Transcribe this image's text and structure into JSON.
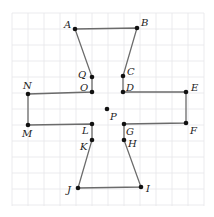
{
  "diagram": {
    "type": "polygon-on-grid",
    "grid": {
      "x0": 12,
      "y0": 13,
      "x1": 204,
      "y1": 206,
      "step": 16,
      "color": "#e6e6ea"
    },
    "edge_color": "#6b6b6b",
    "point_color": "#111111",
    "polygon_order": [
      "A",
      "B",
      "C",
      "D",
      "E",
      "F",
      "G",
      "H",
      "I",
      "J",
      "K",
      "L",
      "M",
      "N",
      "O",
      "Q"
    ],
    "points": [
      {
        "name": "A",
        "x": 75,
        "y": 29,
        "label": "A",
        "lx": 64,
        "ly": 28
      },
      {
        "name": "B",
        "x": 137,
        "y": 28,
        "label": "B",
        "lx": 141,
        "ly": 26
      },
      {
        "name": "C",
        "x": 123,
        "y": 76,
        "label": "C",
        "lx": 127,
        "ly": 75
      },
      {
        "name": "D",
        "x": 123,
        "y": 92,
        "label": "D",
        "lx": 126,
        "ly": 91
      },
      {
        "name": "E",
        "x": 186,
        "y": 92,
        "label": "E",
        "lx": 191,
        "ly": 91
      },
      {
        "name": "F",
        "x": 186,
        "y": 123,
        "label": "F",
        "lx": 190,
        "ly": 134
      },
      {
        "name": "G",
        "x": 124,
        "y": 124,
        "label": "G",
        "lx": 126,
        "ly": 135
      },
      {
        "name": "H",
        "x": 124,
        "y": 140,
        "label": "H",
        "lx": 128,
        "ly": 147
      },
      {
        "name": "I",
        "x": 141,
        "y": 187,
        "label": "I",
        "lx": 146,
        "ly": 192
      },
      {
        "name": "J",
        "x": 78,
        "y": 188,
        "label": "J",
        "lx": 67,
        "ly": 193
      },
      {
        "name": "K",
        "x": 92,
        "y": 140,
        "label": "K",
        "lx": 80,
        "ly": 150
      },
      {
        "name": "L",
        "x": 92,
        "y": 124,
        "label": "L",
        "lx": 82,
        "ly": 134
      },
      {
        "name": "M",
        "x": 28,
        "y": 125,
        "label": "M",
        "lx": 22,
        "ly": 137
      },
      {
        "name": "N",
        "x": 28,
        "y": 94,
        "label": "N",
        "lx": 23,
        "ly": 89
      },
      {
        "name": "O",
        "x": 92,
        "y": 92,
        "label": "O",
        "lx": 80,
        "ly": 91
      },
      {
        "name": "Q",
        "x": 92,
        "y": 77,
        "label": "Q",
        "lx": 78,
        "ly": 78
      },
      {
        "name": "P",
        "x": 107,
        "y": 109,
        "label": "P",
        "lx": 110,
        "ly": 120,
        "isolated": true
      }
    ]
  }
}
